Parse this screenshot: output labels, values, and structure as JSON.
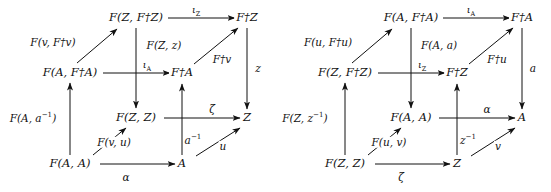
{
  "figure": {
    "kind": "commutative-cube-diagram-pair",
    "count": 2
  },
  "diagrams": [
    {
      "id": "left-cube",
      "nodes": [
        {
          "name": "node-back-top-left",
          "label": "F(Z, F†Z)",
          "x": 136,
          "y": 18
        },
        {
          "name": "node-back-top-right",
          "label": "F†Z",
          "x": 247,
          "y": 18
        },
        {
          "name": "node-front-top-left",
          "label": "F(A, F†A)",
          "x": 70,
          "y": 73
        },
        {
          "name": "node-front-top-right",
          "label": "F†A",
          "x": 182,
          "y": 73
        },
        {
          "name": "node-back-bot-left",
          "label": "F(Z, Z)",
          "x": 136,
          "y": 118
        },
        {
          "name": "node-back-bot-right",
          "label": "Z",
          "x": 247,
          "y": 118
        },
        {
          "name": "node-front-bot-left",
          "label": "F(A, A)",
          "x": 70,
          "y": 164
        },
        {
          "name": "node-front-bot-right",
          "label": "A",
          "x": 182,
          "y": 164
        }
      ],
      "edges": [
        {
          "name": "edge-iota-z",
          "label": "ιZ",
          "lx": 196,
          "ly": 10,
          "sub": "Z"
        },
        {
          "name": "edge-iota-a",
          "label": "ιA",
          "lx": 147,
          "ly": 65,
          "sub": "A"
        },
        {
          "name": "edge-zeta",
          "label": "ζ",
          "lx": 212,
          "ly": 109
        },
        {
          "name": "edge-alpha",
          "label": "α",
          "lx": 126,
          "ly": 177
        },
        {
          "name": "edge-F-v-Fdagv",
          "label": "F(v, F†v)",
          "lx": 53,
          "ly": 42
        },
        {
          "name": "edge-Fdag-v",
          "label": "F†v",
          "lx": 222,
          "ly": 59
        },
        {
          "name": "edge-F-v-u",
          "label": "F(v, u)",
          "lx": 114,
          "ly": 142
        },
        {
          "name": "edge-u",
          "label": "u",
          "lx": 223,
          "ly": 146
        },
        {
          "name": "edge-F-Z-z",
          "label": "F(Z, z)",
          "lx": 164,
          "ly": 45
        },
        {
          "name": "edge-z",
          "label": "z",
          "lx": 258,
          "ly": 68
        },
        {
          "name": "edge-F-A-ainv",
          "label": "F(A, a⁻¹)",
          "lx": 33,
          "ly": 118
        },
        {
          "name": "edge-a-inv",
          "label": "a⁻¹",
          "lx": 193,
          "ly": 140
        }
      ]
    },
    {
      "id": "right-cube",
      "nodes": [
        {
          "name": "node-back-top-left",
          "label": "F(A, F†A)",
          "x": 140,
          "y": 18
        },
        {
          "name": "node-back-top-right",
          "label": "F†A",
          "x": 251,
          "y": 18
        },
        {
          "name": "node-front-top-left",
          "label": "F(Z, F†Z)",
          "x": 74,
          "y": 73
        },
        {
          "name": "node-front-top-right",
          "label": "F†Z",
          "x": 186,
          "y": 73
        },
        {
          "name": "node-back-bot-left",
          "label": "F(A, A)",
          "x": 140,
          "y": 118
        },
        {
          "name": "node-back-bot-right",
          "label": "A",
          "x": 251,
          "y": 118
        },
        {
          "name": "node-front-bot-left",
          "label": "F(Z, Z)",
          "x": 74,
          "y": 164
        },
        {
          "name": "node-front-bot-right",
          "label": "Z",
          "x": 186,
          "y": 164
        }
      ],
      "edges": [
        {
          "name": "edge-iota-a",
          "label": "ιA",
          "lx": 200,
          "ly": 10,
          "sub": "A"
        },
        {
          "name": "edge-iota-z",
          "label": "ιZ",
          "lx": 151,
          "ly": 65,
          "sub": "Z"
        },
        {
          "name": "edge-alpha",
          "label": "α",
          "lx": 216,
          "ly": 109
        },
        {
          "name": "edge-zeta",
          "label": "ζ",
          "lx": 130,
          "ly": 177
        },
        {
          "name": "edge-F-u-Fdagu",
          "label": "F(u, F†u)",
          "lx": 57,
          "ly": 42
        },
        {
          "name": "edge-Fdag-u",
          "label": "F†u",
          "lx": 226,
          "ly": 59
        },
        {
          "name": "edge-F-u-v",
          "label": "F(u, v)",
          "lx": 118,
          "ly": 142
        },
        {
          "name": "edge-v",
          "label": "v",
          "lx": 227,
          "ly": 146
        },
        {
          "name": "edge-F-A-a",
          "label": "F(A, a)",
          "lx": 168,
          "ly": 45
        },
        {
          "name": "edge-a",
          "label": "a",
          "lx": 262,
          "ly": 68
        },
        {
          "name": "edge-F-Z-zinv",
          "label": "F(Z, z⁻¹)",
          "lx": 34,
          "ly": 118
        },
        {
          "name": "edge-z-inv",
          "label": "z⁻¹",
          "lx": 197,
          "ly": 140
        }
      ]
    }
  ],
  "style": {
    "stroke": "#111111",
    "background": "#ffffff"
  }
}
